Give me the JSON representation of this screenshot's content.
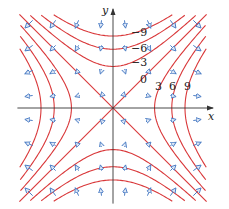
{
  "figure": {
    "function": "x^2 - y^2",
    "gradient": "(2x, -2y)",
    "axes": {
      "x_label": "x",
      "y_label": "y"
    },
    "domain": {
      "x": [
        -3.9,
        3.9
      ],
      "y": [
        -3.9,
        3.9
      ]
    },
    "level_curves": {
      "values": [
        -9,
        -6,
        -3,
        0,
        3,
        6,
        9
      ],
      "labels": [
        {
          "value": -9,
          "text": "−9"
        },
        {
          "value": -6,
          "text": "−6"
        },
        {
          "value": -3,
          "text": "−3"
        },
        {
          "value": 0,
          "text": "0"
        },
        {
          "value": 3,
          "text": "3"
        },
        {
          "value": 6,
          "text": "6"
        },
        {
          "value": 9,
          "text": "9"
        }
      ]
    },
    "vector_grid": {
      "x": [
        -3.5,
        -2.5,
        -1.5,
        -0.5,
        0.5,
        1.5,
        2.5,
        3.5
      ],
      "y": [
        -3.5,
        -2.5,
        -1.5,
        -0.5,
        0.5,
        1.5,
        2.5,
        3.5
      ]
    },
    "colors": {
      "curve": "#d9383a",
      "vector": "#4a7cc4",
      "axis": "#333333"
    }
  }
}
